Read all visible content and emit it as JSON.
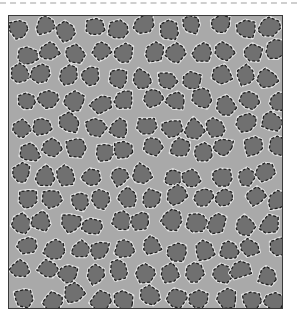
{
  "image": {
    "description": "Grayscale micrograph of a cellular foam-like network; dark gray cells outlined with dashed black/white contours on a lighter gray matrix",
    "colors": {
      "matrix": "#a9a9a9",
      "cell_fill": "#707070",
      "outline_dark": "#1e1e1e",
      "outline_light": "#e6e6e6",
      "frame_border": "#3a3a3a",
      "top_dash": "#cfcfcf"
    },
    "grid": {
      "cols": 11,
      "rows": 12,
      "cell_w": 25,
      "cell_h": 24.5
    }
  }
}
